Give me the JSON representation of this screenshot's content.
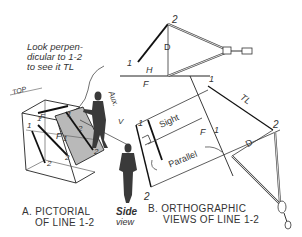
{
  "note": {
    "lines": [
      "Look perpen-",
      "dicular to 1-2",
      "to see it TL"
    ]
  },
  "captions": {
    "a_line1": "A. PICTORIAL",
    "a_line2": "OF LINE 1-2",
    "b_line1": "B. ORTHOGRAPHIC",
    "b_line2": "VIEWS OF LINE 1-2"
  },
  "side_view": {
    "line1": "Side",
    "line2": "view"
  },
  "labels": {
    "top_1": "1",
    "top_2": "2",
    "top_D": "D",
    "H": "H",
    "F": "F",
    "front_1": "1",
    "aux_1": "1",
    "TL": "TL",
    "aux_2": "2",
    "aux_D": "D",
    "front_2": "2",
    "sight": "Sight",
    "parallel": "Parallel",
    "fold_F": "F",
    "fold_1": "1",
    "pic_TOP": "TOP",
    "pic_F": "F",
    "pic_1a": "1",
    "pic_1b": "1",
    "pic_2a": "2",
    "pic_2b": "2",
    "pic_F1": "F",
    "pic_1c": "1",
    "pic_aux1": "1",
    "pic_aux2": "2",
    "pic_aux2b": "2",
    "aux_label": "Aux.",
    "aux_v": "V"
  },
  "colors": {
    "ink": "#222222",
    "plane": "#b9b9b9",
    "figure": "#3a3a3a"
  }
}
